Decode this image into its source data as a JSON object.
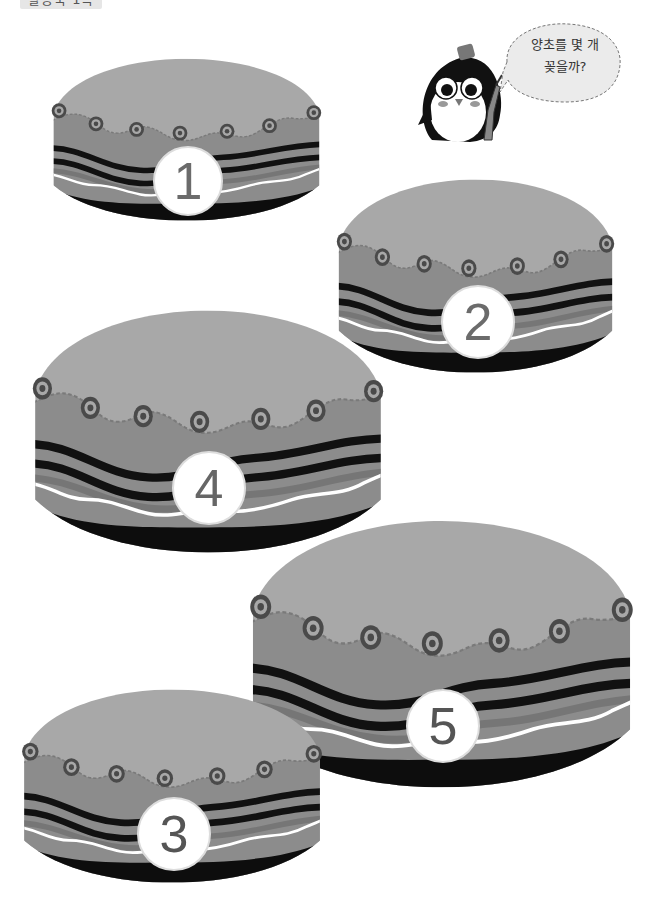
{
  "page_label": "활동북 1쪽",
  "speech_bubble": {
    "line1": "양초를 몇 개",
    "line2": "꽂을까?"
  },
  "character": "penguin",
  "colors": {
    "cake_top": "#a8a8a8",
    "cake_band": "#8c8c8c",
    "cake_stripe_dark": "#111111",
    "cake_stripe_mid": "#7a7a7a",
    "cake_base": "#0d0d0d",
    "dot_ring": "#4a4a4a",
    "number_circle": "#ffffff",
    "number_text": "#6b6b6b"
  },
  "cakes": [
    {
      "id": "cake-1",
      "number": "1"
    },
    {
      "id": "cake-2",
      "number": "2"
    },
    {
      "id": "cake-3",
      "number": "3"
    },
    {
      "id": "cake-4",
      "number": "4"
    },
    {
      "id": "cake-5",
      "number": "5"
    }
  ]
}
